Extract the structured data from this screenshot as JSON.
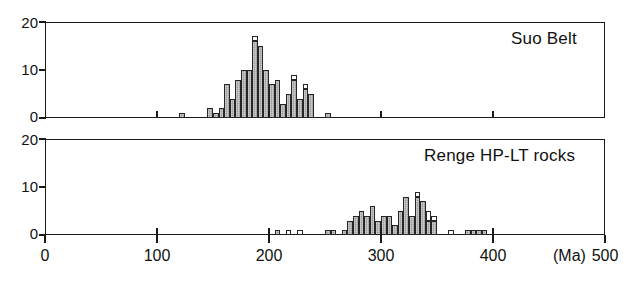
{
  "figure": {
    "background": "#ffffff",
    "bar_fill_color": "#9e9e9e",
    "bar_open_color": "#ffffff",
    "bar_edge_color": "#262626",
    "axis_color": "#1a1a1a"
  },
  "chart_data": {
    "type": "bar",
    "title": "",
    "xlabel": "(Ma)",
    "ylabel": "",
    "xlim": [
      0,
      500
    ],
    "ylim": [
      0,
      20
    ],
    "xticks": [
      0,
      100,
      200,
      300,
      400,
      500
    ],
    "xtick_labels": [
      "0",
      "100",
      "200",
      "300",
      "400",
      "500"
    ],
    "yticks": [
      0,
      10,
      20
    ],
    "ytick_labels": [
      "0",
      "10",
      "20"
    ],
    "grid": false,
    "legend": "none",
    "bin_width": 5,
    "panels": [
      {
        "label": "Suo Belt",
        "bins": [
          {
            "x": 120,
            "filled": 1,
            "open": 0
          },
          {
            "x": 145,
            "filled": 2,
            "open": 0
          },
          {
            "x": 150,
            "filled": 1,
            "open": 0
          },
          {
            "x": 155,
            "filled": 2,
            "open": 0
          },
          {
            "x": 160,
            "filled": 7,
            "open": 0
          },
          {
            "x": 165,
            "filled": 4,
            "open": 0
          },
          {
            "x": 170,
            "filled": 8,
            "open": 0
          },
          {
            "x": 175,
            "filled": 10,
            "open": 0
          },
          {
            "x": 180,
            "filled": 10,
            "open": 0
          },
          {
            "x": 185,
            "filled": 16,
            "open": 1
          },
          {
            "x": 190,
            "filled": 15,
            "open": 0
          },
          {
            "x": 195,
            "filled": 10,
            "open": 0
          },
          {
            "x": 200,
            "filled": 7,
            "open": 0
          },
          {
            "x": 205,
            "filled": 8,
            "open": 0
          },
          {
            "x": 210,
            "filled": 3,
            "open": 0
          },
          {
            "x": 215,
            "filled": 5,
            "open": 0
          },
          {
            "x": 220,
            "filled": 8,
            "open": 1
          },
          {
            "x": 225,
            "filled": 4,
            "open": 0
          },
          {
            "x": 230,
            "filled": 6,
            "open": 1
          },
          {
            "x": 235,
            "filled": 5,
            "open": 0
          },
          {
            "x": 250,
            "filled": 1,
            "open": 0
          }
        ]
      },
      {
        "label": "Renge HP-LT rocks",
        "bins": [
          {
            "x": 205,
            "filled": 1,
            "open": 0
          },
          {
            "x": 215,
            "filled": 0,
            "open": 1
          },
          {
            "x": 225,
            "filled": 0,
            "open": 1
          },
          {
            "x": 250,
            "filled": 1,
            "open": 0
          },
          {
            "x": 255,
            "filled": 1,
            "open": 0
          },
          {
            "x": 265,
            "filled": 1,
            "open": 0
          },
          {
            "x": 270,
            "filled": 3,
            "open": 0
          },
          {
            "x": 275,
            "filled": 4,
            "open": 0
          },
          {
            "x": 280,
            "filled": 5,
            "open": 0
          },
          {
            "x": 285,
            "filled": 4,
            "open": 0
          },
          {
            "x": 290,
            "filled": 6,
            "open": 0
          },
          {
            "x": 295,
            "filled": 3,
            "open": 0
          },
          {
            "x": 300,
            "filled": 4,
            "open": 0
          },
          {
            "x": 305,
            "filled": 4,
            "open": 0
          },
          {
            "x": 310,
            "filled": 2,
            "open": 0
          },
          {
            "x": 315,
            "filled": 5,
            "open": 0
          },
          {
            "x": 320,
            "filled": 8,
            "open": 0
          },
          {
            "x": 325,
            "filled": 4,
            "open": 0
          },
          {
            "x": 330,
            "filled": 8,
            "open": 1
          },
          {
            "x": 335,
            "filled": 7,
            "open": 0
          },
          {
            "x": 340,
            "filled": 3,
            "open": 2
          },
          {
            "x": 345,
            "filled": 3,
            "open": 1
          },
          {
            "x": 360,
            "filled": 0,
            "open": 1
          },
          {
            "x": 375,
            "filled": 1,
            "open": 0
          },
          {
            "x": 380,
            "filled": 1,
            "open": 0
          },
          {
            "x": 385,
            "filled": 1,
            "open": 0
          },
          {
            "x": 390,
            "filled": 1,
            "open": 0
          }
        ]
      }
    ]
  }
}
